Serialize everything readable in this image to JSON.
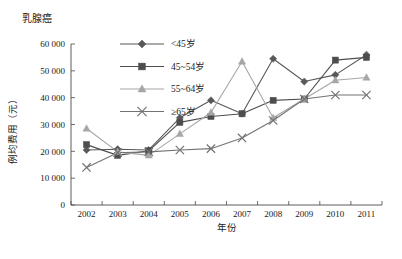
{
  "chart_data": {
    "type": "line",
    "title": "乳腺癌",
    "xlabel": "年份",
    "ylabel": "例均费用（元）",
    "categories": [
      "2002",
      "2003",
      "2004",
      "2005",
      "2006",
      "2007",
      "2008",
      "2009",
      "2010",
      "2011"
    ],
    "x": [
      2002,
      2003,
      2004,
      2005,
      2006,
      2007,
      2008,
      2009,
      2010,
      2011
    ],
    "ylim": [
      0,
      60000
    ],
    "ytick_labels": [
      "0",
      "10 000",
      "20 000",
      "30 000",
      "40 000",
      "50 000",
      "60 000"
    ],
    "ytick_values": [
      0,
      10000,
      20000,
      30000,
      40000,
      50000,
      60000
    ],
    "grid": false,
    "legend_position": "top-center",
    "series": [
      {
        "name": "<45岁",
        "marker": "diamond",
        "color": "#595959",
        "values": [
          20500,
          20800,
          20500,
          32500,
          39000,
          34000,
          54500,
          46000,
          48500,
          56000
        ]
      },
      {
        "name": "45~54岁",
        "marker": "square",
        "color": "#4d4d4d",
        "values": [
          22500,
          18500,
          20200,
          30800,
          33000,
          34000,
          39000,
          39500,
          54000,
          55000
        ]
      },
      {
        "name": "55~64岁",
        "marker": "triangle",
        "color": "#a6a6a6",
        "values": [
          28500,
          19800,
          18500,
          26500,
          34500,
          53500,
          32500,
          39500,
          46500,
          47500
        ]
      },
      {
        "name": "≥65岁",
        "marker": "cross",
        "color": "#737373",
        "values": [
          14000,
          19500,
          19800,
          20500,
          21000,
          25000,
          31500,
          39500,
          41000,
          41000
        ]
      }
    ]
  }
}
